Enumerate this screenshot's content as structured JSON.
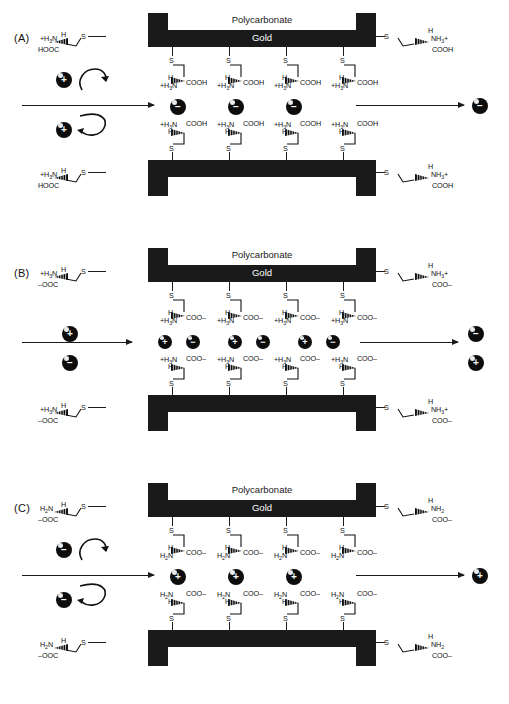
{
  "figure": {
    "type": "diagram"
  },
  "labels": {
    "polycarbonate": "Polycarbonate",
    "gold": "Gold",
    "sulfur": "S"
  },
  "panels": [
    {
      "id": "A",
      "tag": "(A)",
      "outer_top_left": {
        "amine": "+H₃N",
        "h": "H",
        "acid": "HOOC",
        "s": "S"
      },
      "outer_top_right": {
        "amine": "NH₃+",
        "h": "H",
        "acid": "COOH",
        "s": "S"
      },
      "outer_bot_left": {
        "amine": "+H₃N",
        "h": "H",
        "acid": "HOOC",
        "s": "S"
      },
      "outer_bot_right": {
        "amine": "NH₃+",
        "h": "H",
        "acid": "COOH",
        "s": "S"
      },
      "inner_upper": {
        "amine": "+H₃N",
        "h": "H",
        "acid": "COOH"
      },
      "inner_lower": {
        "amine": "+H₃N",
        "h": "H",
        "acid": "COOH"
      },
      "feed_spheres": [
        "+",
        "+"
      ],
      "pore_spheres": [
        "−",
        "−",
        "−"
      ],
      "permeate_spheres": [
        "−"
      ],
      "rejected": true,
      "columns": 4
    },
    {
      "id": "B",
      "tag": "(B)",
      "outer_top_left": {
        "amine": "+H₃N",
        "h": "H",
        "acid": "–OOC",
        "s": "S"
      },
      "outer_top_right": {
        "amine": "NH₃+",
        "h": "H",
        "acid": "COO–",
        "s": "S"
      },
      "outer_bot_left": {
        "amine": "+H₃N",
        "h": "H",
        "acid": "–OOC",
        "s": "S"
      },
      "outer_bot_right": {
        "amine": "NH₃+",
        "h": "H",
        "acid": "COO–",
        "s": "S"
      },
      "inner_upper": {
        "amine": "+H₃N",
        "h": "H",
        "acid": "COO–"
      },
      "inner_lower": {
        "amine": "+H₃N",
        "h": "H",
        "acid": "COO–"
      },
      "feed_spheres": [
        "+",
        "−"
      ],
      "pore_spheres": [
        "+",
        "−",
        "+",
        "−",
        "+",
        "−"
      ],
      "permeate_spheres": [
        "−",
        "+"
      ],
      "rejected": false,
      "columns": 4
    },
    {
      "id": "C",
      "tag": "(C)",
      "outer_top_left": {
        "amine": "H₂N",
        "h": "H",
        "acid": "–OOC",
        "s": "S"
      },
      "outer_top_right": {
        "amine": "NH₂",
        "h": "H",
        "acid": "COO–",
        "s": "S"
      },
      "outer_bot_left": {
        "amine": "H₂N",
        "h": "H",
        "acid": "–OOC",
        "s": "S"
      },
      "outer_bot_right": {
        "amine": "NH₂",
        "h": "H",
        "acid": "COO–",
        "s": "S"
      },
      "inner_upper": {
        "amine": "H₂N",
        "h": "H",
        "acid": "COO–"
      },
      "inner_lower": {
        "amine": "H₂N",
        "h": "H",
        "acid": "COO–"
      },
      "feed_spheres": [
        "−",
        "−"
      ],
      "pore_spheres": [
        "+",
        "+",
        "+"
      ],
      "permeate_spheres": [
        "+"
      ],
      "rejected": true,
      "columns": 4
    }
  ],
  "colors": {
    "membrane": "#1a1a1a",
    "sphere": "#0d0d0d",
    "background": "#ffffff",
    "text": "#111111",
    "gold_label_text": "#ffffff"
  }
}
